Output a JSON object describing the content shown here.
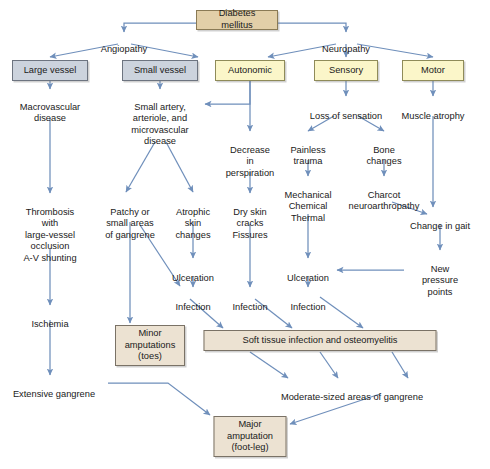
{
  "diagram": {
    "colors": {
      "arrow": "#6f8fbb",
      "box_tan": "#e2cfa8",
      "box_grey": "#ccd3dd",
      "box_yellow": "#fbf6c9",
      "box_beige": "#ece2d2",
      "text": "#1a1a1a",
      "background": "#ffffff"
    },
    "nodes": {
      "diabetes_mellitus": "Diabetes mellitus",
      "angiopathy": "Angiopathy",
      "neuropathy": "Neuropathy",
      "large_vessel": "Large vessel",
      "small_vessel": "Small vessel",
      "autonomic": "Autonomic",
      "sensory": "Sensory",
      "motor": "Motor",
      "macrovascular_disease": "Macrovascular\ndisease",
      "small_artery_disease": "Small artery,\narteriole, and\nmicrovascular\ndisease",
      "decrease_perspiration": "Decrease\nin\nperspiration",
      "loss_of_sensation": "Loss of sensation",
      "muscle_atrophy": "Muscle atrophy",
      "painless_trauma": "Painless\ntrauma",
      "bone_changes": "Bone\nchanges",
      "mechanical_chemical_thermal": "Mechanical\nChemical\nThermal",
      "charcot_neuroarthropathy": "Charcot\nneuroarthropathy",
      "change_in_gait": "Change in gait",
      "new_pressure_points": "New\npressure\npoints",
      "thrombosis": "Thrombosis\nwith\nlarge-vessel\nocclusion\nA-V shunting",
      "patchy_gangrene": "Patchy or\nsmall areas\nof gangrene",
      "atrophic_skin_changes": "Atrophic\nskin\nchanges",
      "dry_skin_cracks_fissures": "Dry skin\ncracks\nFissures",
      "ulceration_mid": "Ulceration",
      "ulceration_right": "Ulceration",
      "infection_left": "Infection",
      "infection_mid": "Infection",
      "infection_right": "Infection",
      "ischemia": "Ischemia",
      "minor_amputations": "Minor\namputations\n(toes)",
      "soft_tissue_infection": "Soft tissue infection and osteomyelitis",
      "extensive_gangrene": "Extensive gangrene",
      "moderate_gangrene": "Moderate-sized areas of gangrene",
      "major_amputation": "Major\namputation\n(foot-leg)"
    },
    "edges": [
      {
        "from": "diabetes_mellitus",
        "to": "angiopathy"
      },
      {
        "from": "diabetes_mellitus",
        "to": "neuropathy"
      },
      {
        "from": "angiopathy",
        "to": "large_vessel"
      },
      {
        "from": "angiopathy",
        "to": "small_vessel"
      },
      {
        "from": "neuropathy",
        "to": "autonomic"
      },
      {
        "from": "neuropathy",
        "to": "sensory"
      },
      {
        "from": "neuropathy",
        "to": "motor"
      },
      {
        "from": "large_vessel",
        "to": "macrovascular_disease"
      },
      {
        "from": "small_vessel",
        "to": "small_artery_disease"
      },
      {
        "from": "autonomic",
        "to": "small_artery_disease"
      },
      {
        "from": "autonomic",
        "to": "decrease_perspiration"
      },
      {
        "from": "sensory",
        "to": "loss_of_sensation"
      },
      {
        "from": "motor",
        "to": "muscle_atrophy"
      },
      {
        "from": "macrovascular_disease",
        "to": "thrombosis"
      },
      {
        "from": "small_artery_disease",
        "to": "patchy_gangrene"
      },
      {
        "from": "small_artery_disease",
        "to": "atrophic_skin_changes"
      },
      {
        "from": "decrease_perspiration",
        "to": "dry_skin_cracks_fissures"
      },
      {
        "from": "loss_of_sensation",
        "to": "painless_trauma"
      },
      {
        "from": "loss_of_sensation",
        "to": "bone_changes"
      },
      {
        "from": "painless_trauma",
        "to": "mechanical_chemical_thermal"
      },
      {
        "from": "bone_changes",
        "to": "charcot_neuroarthropathy"
      },
      {
        "from": "charcot_neuroarthropathy",
        "to": "change_in_gait"
      },
      {
        "from": "muscle_atrophy",
        "to": "change_in_gait"
      },
      {
        "from": "change_in_gait",
        "to": "new_pressure_points"
      },
      {
        "from": "new_pressure_points",
        "to": "ulceration_right"
      },
      {
        "from": "thrombosis",
        "to": "ischemia"
      },
      {
        "from": "patchy_gangrene",
        "to": "minor_amputations"
      },
      {
        "from": "patchy_gangrene",
        "to": "infection_left"
      },
      {
        "from": "atrophic_skin_changes",
        "to": "ulceration_mid"
      },
      {
        "from": "ulceration_mid",
        "to": "infection_left"
      },
      {
        "from": "dry_skin_cracks_fissures",
        "to": "infection_mid"
      },
      {
        "from": "mechanical_chemical_thermal",
        "to": "ulceration_right"
      },
      {
        "from": "ulceration_right",
        "to": "infection_right"
      },
      {
        "from": "infection_left",
        "to": "soft_tissue_infection"
      },
      {
        "from": "infection_mid",
        "to": "soft_tissue_infection"
      },
      {
        "from": "infection_right",
        "to": "soft_tissue_infection"
      },
      {
        "from": "ischemia",
        "to": "extensive_gangrene"
      },
      {
        "from": "soft_tissue_infection",
        "to": "moderate_gangrene"
      },
      {
        "from": "extensive_gangrene",
        "to": "major_amputation"
      },
      {
        "from": "moderate_gangrene",
        "to": "major_amputation"
      }
    ]
  }
}
